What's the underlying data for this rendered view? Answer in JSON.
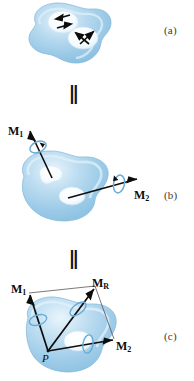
{
  "figure": {
    "caption_labels": {
      "a": "(a)",
      "b": "(b)",
      "c": "(c)"
    },
    "equivalence_symbol": "‖",
    "colors": {
      "body_fill_light": "#d6eaf7",
      "body_fill_mid": "#a9cfe9",
      "body_fill_dark": "#8dbfe0",
      "body_edge": "#79b2d8",
      "cavity_fill": "#f2fafd",
      "vector_stroke": "#0d0d0d",
      "spin_ring": "#6fb0d8",
      "construction_line": "#4a4a4a",
      "label_text": "#0d0d0d",
      "part_label_text": "#3a3a3a"
    }
  },
  "panel_a": {
    "name": "body-with-spin-arrow-pairs",
    "cavities": [
      {
        "id": "cavity-upper",
        "arrow_pair": "two-antiparallel-arrows"
      },
      {
        "id": "cavity-lower",
        "arrow_pair": "two-antiparallel-arrows"
      }
    ],
    "part_label": "(a)"
  },
  "panel_b": {
    "name": "body-with-two-moment-vectors",
    "part_label": "(b)",
    "vectors": [
      {
        "id": "M1",
        "symbol": "M",
        "subscript": "1"
      },
      {
        "id": "M2",
        "symbol": "M",
        "subscript": "2"
      }
    ],
    "spin_rings": 2
  },
  "panel_c": {
    "name": "resultant-moment-parallelogram",
    "part_label": "(c)",
    "origin_point_label": "P",
    "vectors": [
      {
        "id": "M1",
        "symbol": "M",
        "subscript": "1"
      },
      {
        "id": "MR",
        "symbol": "M",
        "subscript": "R"
      },
      {
        "id": "M2",
        "symbol": "M",
        "subscript": "2"
      }
    ],
    "construction": "parallelogram-law"
  }
}
